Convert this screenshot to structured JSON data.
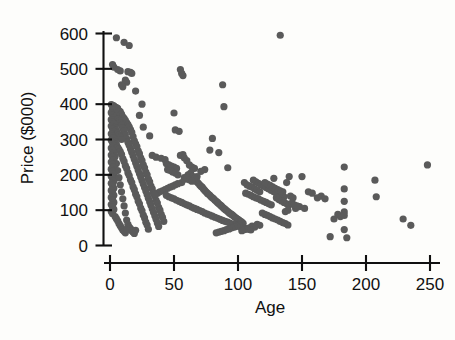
{
  "figure": {
    "type": "scatter-plot",
    "background_color": "#fdfdfb",
    "marker_color": "#5a5a5a",
    "axis_color": "#101010"
  },
  "axis": {
    "y_title": "Price ($000)",
    "x_title": "Age",
    "y_ticks": [
      "0",
      "100",
      "200",
      "300",
      "400",
      "500",
      "600"
    ],
    "x_ticks": [
      "0",
      "50",
      "100",
      "150",
      "200",
      "250"
    ]
  },
  "chart_data": {
    "type": "scatter",
    "title": "",
    "xlabel": "Age",
    "ylabel": "Price ($000)",
    "xlim": [
      0,
      250
    ],
    "ylim": [
      0,
      600
    ],
    "xticks": [
      0,
      50,
      100,
      150,
      200,
      250
    ],
    "yticks": [
      0,
      100,
      200,
      300,
      400,
      500,
      600
    ],
    "grid": false,
    "legend": "none",
    "marker": "filled-circle",
    "marker_color": "#5a5a5a",
    "n_points": 452,
    "points": [
      [
        5,
        588
      ],
      [
        11,
        575
      ],
      [
        15,
        566
      ],
      [
        2,
        512
      ],
      [
        3,
        505
      ],
      [
        6,
        498
      ],
      [
        8,
        494
      ],
      [
        14,
        492
      ],
      [
        16,
        490
      ],
      [
        17,
        487
      ],
      [
        12,
        468
      ],
      [
        13,
        462
      ],
      [
        9,
        455
      ],
      [
        10,
        449
      ],
      [
        20,
        437
      ],
      [
        25,
        400
      ],
      [
        1,
        399
      ],
      [
        2,
        397
      ],
      [
        3,
        395
      ],
      [
        4,
        392
      ],
      [
        5,
        390
      ],
      [
        6,
        388
      ],
      [
        2,
        385
      ],
      [
        3,
        383
      ],
      [
        7,
        381
      ],
      [
        8,
        379
      ],
      [
        1,
        376
      ],
      [
        4,
        374
      ],
      [
        9,
        372
      ],
      [
        2,
        370
      ],
      [
        23,
        368
      ],
      [
        5,
        366
      ],
      [
        10,
        364
      ],
      [
        3,
        362
      ],
      [
        11,
        360
      ],
      [
        6,
        358
      ],
      [
        1,
        356
      ],
      [
        12,
        354
      ],
      [
        7,
        352
      ],
      [
        2,
        350
      ],
      [
        13,
        348
      ],
      [
        8,
        346
      ],
      [
        3,
        344
      ],
      [
        14,
        342
      ],
      [
        9,
        340
      ],
      [
        1,
        338
      ],
      [
        15,
        336
      ],
      [
        4,
        334
      ],
      [
        10,
        332
      ],
      [
        2,
        330
      ],
      [
        16,
        328
      ],
      [
        5,
        326
      ],
      [
        11,
        324
      ],
      [
        3,
        322
      ],
      [
        17,
        320
      ],
      [
        6,
        318
      ],
      [
        1,
        316
      ],
      [
        12,
        314
      ],
      [
        7,
        312
      ],
      [
        2,
        310
      ],
      [
        18,
        308
      ],
      [
        8,
        306
      ],
      [
        3,
        304
      ],
      [
        13,
        302
      ],
      [
        9,
        300
      ],
      [
        1,
        298
      ],
      [
        19,
        296
      ],
      [
        4,
        294
      ],
      [
        14,
        292
      ],
      [
        2,
        290
      ],
      [
        20,
        288
      ],
      [
        5,
        286
      ],
      [
        15,
        284
      ],
      [
        3,
        282
      ],
      [
        21,
        280
      ],
      [
        6,
        278
      ],
      [
        1,
        276
      ],
      [
        16,
        274
      ],
      [
        7,
        272
      ],
      [
        2,
        270
      ],
      [
        22,
        268
      ],
      [
        8,
        266
      ],
      [
        17,
        264
      ],
      [
        3,
        262
      ],
      [
        23,
        260
      ],
      [
        9,
        258
      ],
      [
        1,
        256
      ],
      [
        18,
        254
      ],
      [
        4,
        252
      ],
      [
        2,
        250
      ],
      [
        24,
        248
      ],
      [
        10,
        246
      ],
      [
        19,
        244
      ],
      [
        3,
        242
      ],
      [
        25,
        240
      ],
      [
        11,
        238
      ],
      [
        1,
        236
      ],
      [
        20,
        234
      ],
      [
        5,
        232
      ],
      [
        2,
        230
      ],
      [
        26,
        228
      ],
      [
        12,
        226
      ],
      [
        21,
        224
      ],
      [
        3,
        222
      ],
      [
        27,
        220
      ],
      [
        13,
        218
      ],
      [
        1,
        216
      ],
      [
        22,
        214
      ],
      [
        6,
        212
      ],
      [
        2,
        210
      ],
      [
        28,
        208
      ],
      [
        14,
        206
      ],
      [
        23,
        204
      ],
      [
        3,
        202
      ],
      [
        29,
        200
      ],
      [
        15,
        198
      ],
      [
        1,
        196
      ],
      [
        24,
        194
      ],
      [
        7,
        192
      ],
      [
        2,
        190
      ],
      [
        30,
        188
      ],
      [
        16,
        186
      ],
      [
        25,
        184
      ],
      [
        3,
        182
      ],
      [
        31,
        180
      ],
      [
        17,
        178
      ],
      [
        1,
        176
      ],
      [
        26,
        174
      ],
      [
        8,
        172
      ],
      [
        2,
        170
      ],
      [
        32,
        168
      ],
      [
        18,
        166
      ],
      [
        27,
        164
      ],
      [
        3,
        162
      ],
      [
        33,
        160
      ],
      [
        19,
        158
      ],
      [
        1,
        156
      ],
      [
        28,
        154
      ],
      [
        9,
        152
      ],
      [
        2,
        150
      ],
      [
        34,
        148
      ],
      [
        20,
        146
      ],
      [
        29,
        144
      ],
      [
        3,
        142
      ],
      [
        35,
        140
      ],
      [
        21,
        138
      ],
      [
        1,
        136
      ],
      [
        30,
        134
      ],
      [
        10,
        132
      ],
      [
        2,
        130
      ],
      [
        36,
        128
      ],
      [
        22,
        126
      ],
      [
        31,
        124
      ],
      [
        3,
        122
      ],
      [
        37,
        120
      ],
      [
        23,
        118
      ],
      [
        1,
        116
      ],
      [
        32,
        114
      ],
      [
        11,
        112
      ],
      [
        2,
        110
      ],
      [
        38,
        108
      ],
      [
        24,
        106
      ],
      [
        33,
        104
      ],
      [
        3,
        102
      ],
      [
        39,
        100
      ],
      [
        25,
        98
      ],
      [
        1,
        96
      ],
      [
        34,
        94
      ],
      [
        12,
        92
      ],
      [
        2,
        90
      ],
      [
        40,
        88
      ],
      [
        26,
        86
      ],
      [
        35,
        84
      ],
      [
        4,
        82
      ],
      [
        41,
        80
      ],
      [
        27,
        78
      ],
      [
        5,
        76
      ],
      [
        36,
        74
      ],
      [
        13,
        72
      ],
      [
        6,
        70
      ],
      [
        42,
        68
      ],
      [
        28,
        66
      ],
      [
        37,
        64
      ],
      [
        7,
        62
      ],
      [
        14,
        60
      ],
      [
        29,
        58
      ],
      [
        8,
        56
      ],
      [
        38,
        54
      ],
      [
        15,
        52
      ],
      [
        9,
        50
      ],
      [
        16,
        48
      ],
      [
        30,
        46
      ],
      [
        10,
        44
      ],
      [
        17,
        42
      ],
      [
        11,
        40
      ],
      [
        18,
        38
      ],
      [
        12,
        36
      ],
      [
        19,
        34
      ],
      [
        13,
        45
      ],
      [
        20,
        43
      ],
      [
        26,
        335
      ],
      [
        31,
        310
      ],
      [
        33,
        255
      ],
      [
        36,
        250
      ],
      [
        40,
        247
      ],
      [
        43,
        243
      ],
      [
        44,
        232
      ],
      [
        46,
        228
      ],
      [
        48,
        225
      ],
      [
        50,
        222
      ],
      [
        52,
        218
      ],
      [
        45,
        215
      ],
      [
        47,
        212
      ],
      [
        49,
        208
      ],
      [
        51,
        205
      ],
      [
        53,
        200
      ],
      [
        55,
        498
      ],
      [
        56,
        487
      ],
      [
        57,
        481
      ],
      [
        50,
        375
      ],
      [
        51,
        327
      ],
      [
        54,
        323
      ],
      [
        57,
        257
      ],
      [
        60,
        240
      ],
      [
        62,
        228
      ],
      [
        64,
        222
      ],
      [
        66,
        218
      ],
      [
        63,
        205
      ],
      [
        61,
        200
      ],
      [
        65,
        195
      ],
      [
        58,
        192
      ],
      [
        59,
        188
      ],
      [
        67,
        185
      ],
      [
        68,
        180
      ],
      [
        69,
        176
      ],
      [
        70,
        172
      ],
      [
        71,
        168
      ],
      [
        72,
        165
      ],
      [
        73,
        160
      ],
      [
        74,
        156
      ],
      [
        75,
        152
      ],
      [
        76,
        148
      ],
      [
        77,
        145
      ],
      [
        78,
        142
      ],
      [
        79,
        138
      ],
      [
        80,
        135
      ],
      [
        81,
        132
      ],
      [
        82,
        128
      ],
      [
        83,
        125
      ],
      [
        84,
        122
      ],
      [
        85,
        118
      ],
      [
        86,
        115
      ],
      [
        87,
        112
      ],
      [
        88,
        108
      ],
      [
        89,
        105
      ],
      [
        90,
        102
      ],
      [
        91,
        99
      ],
      [
        92,
        96
      ],
      [
        93,
        93
      ],
      [
        94,
        90
      ],
      [
        95,
        88
      ],
      [
        96,
        85
      ],
      [
        97,
        82
      ],
      [
        98,
        79
      ],
      [
        99,
        76
      ],
      [
        100,
        74
      ],
      [
        101,
        71
      ],
      [
        102,
        68
      ],
      [
        103,
        66
      ],
      [
        104,
        63
      ],
      [
        88,
        455
      ],
      [
        89,
        393
      ],
      [
        80,
        303
      ],
      [
        78,
        270
      ],
      [
        85,
        263
      ],
      [
        92,
        220
      ],
      [
        74,
        215
      ],
      [
        71,
        210
      ],
      [
        68,
        195
      ],
      [
        66,
        190
      ],
      [
        55,
        255
      ],
      [
        58,
        248
      ],
      [
        60,
        192
      ],
      [
        62,
        186
      ],
      [
        64,
        182
      ],
      [
        56,
        178
      ],
      [
        53,
        175
      ],
      [
        51,
        172
      ],
      [
        49,
        168
      ],
      [
        47,
        165
      ],
      [
        45,
        162
      ],
      [
        43,
        158
      ],
      [
        41,
        155
      ],
      [
        39,
        152
      ],
      [
        37,
        148
      ],
      [
        35,
        145
      ],
      [
        44,
        142
      ],
      [
        46,
        138
      ],
      [
        48,
        135
      ],
      [
        50,
        132
      ],
      [
        52,
        128
      ],
      [
        54,
        125
      ],
      [
        56,
        122
      ],
      [
        58,
        118
      ],
      [
        60,
        115
      ],
      [
        62,
        112
      ],
      [
        64,
        108
      ],
      [
        66,
        105
      ],
      [
        68,
        102
      ],
      [
        70,
        99
      ],
      [
        72,
        96
      ],
      [
        74,
        92
      ],
      [
        76,
        89
      ],
      [
        78,
        86
      ],
      [
        80,
        83
      ],
      [
        82,
        80
      ],
      [
        84,
        77
      ],
      [
        86,
        74
      ],
      [
        88,
        71
      ],
      [
        90,
        68
      ],
      [
        92,
        66
      ],
      [
        94,
        63
      ],
      [
        96,
        60
      ],
      [
        98,
        58
      ],
      [
        100,
        55
      ],
      [
        102,
        53
      ],
      [
        104,
        50
      ],
      [
        106,
        48
      ],
      [
        108,
        46
      ],
      [
        110,
        44
      ],
      [
        105,
        178
      ],
      [
        107,
        172
      ],
      [
        109,
        168
      ],
      [
        111,
        165
      ],
      [
        113,
        160
      ],
      [
        115,
        156
      ],
      [
        117,
        152
      ],
      [
        106,
        148
      ],
      [
        108,
        145
      ],
      [
        110,
        142
      ],
      [
        112,
        138
      ],
      [
        114,
        135
      ],
      [
        116,
        132
      ],
      [
        118,
        128
      ],
      [
        120,
        125
      ],
      [
        122,
        122
      ],
      [
        124,
        118
      ],
      [
        126,
        115
      ],
      [
        112,
        185
      ],
      [
        114,
        180
      ],
      [
        116,
        176
      ],
      [
        118,
        172
      ],
      [
        120,
        168
      ],
      [
        122,
        164
      ],
      [
        124,
        160
      ],
      [
        126,
        156
      ],
      [
        128,
        152
      ],
      [
        130,
        148
      ],
      [
        132,
        145
      ],
      [
        134,
        142
      ],
      [
        136,
        138
      ],
      [
        138,
        178
      ],
      [
        140,
        195
      ],
      [
        128,
        190
      ],
      [
        130,
        135
      ],
      [
        132,
        130
      ],
      [
        134,
        126
      ],
      [
        136,
        122
      ],
      [
        138,
        118
      ],
      [
        140,
        115
      ],
      [
        135,
        152
      ],
      [
        133,
        155
      ],
      [
        131,
        158
      ],
      [
        129,
        162
      ],
      [
        127,
        166
      ],
      [
        125,
        170
      ],
      [
        123,
        174
      ],
      [
        121,
        178
      ],
      [
        119,
        92
      ],
      [
        121,
        88
      ],
      [
        123,
        85
      ],
      [
        125,
        82
      ],
      [
        127,
        78
      ],
      [
        129,
        75
      ],
      [
        131,
        72
      ],
      [
        133,
        68
      ],
      [
        135,
        65
      ],
      [
        137,
        62
      ],
      [
        139,
        58
      ],
      [
        141,
        140
      ],
      [
        143,
        135
      ],
      [
        115,
        60
      ],
      [
        117,
        57
      ],
      [
        111,
        55
      ],
      [
        113,
        52
      ],
      [
        109,
        50
      ],
      [
        107,
        47
      ],
      [
        105,
        45
      ],
      [
        103,
        42
      ],
      [
        101,
        58
      ],
      [
        99,
        55
      ],
      [
        97,
        52
      ],
      [
        95,
        50
      ],
      [
        93,
        47
      ],
      [
        91,
        45
      ],
      [
        89,
        42
      ],
      [
        87,
        40
      ],
      [
        85,
        38
      ],
      [
        83,
        36
      ],
      [
        133,
        595
      ],
      [
        145,
        105
      ],
      [
        148,
        110
      ],
      [
        152,
        105
      ],
      [
        150,
        195
      ],
      [
        155,
        152
      ],
      [
        158,
        148
      ],
      [
        162,
        135
      ],
      [
        172,
        25
      ],
      [
        175,
        75
      ],
      [
        178,
        88
      ],
      [
        180,
        82
      ],
      [
        183,
        222
      ],
      [
        183,
        160
      ],
      [
        183,
        125
      ],
      [
        183,
        95
      ],
      [
        183,
        85
      ],
      [
        183,
        45
      ],
      [
        185,
        22
      ],
      [
        207,
        185
      ],
      [
        208,
        138
      ],
      [
        229,
        75
      ],
      [
        235,
        57
      ],
      [
        248,
        228
      ],
      [
        165,
        140
      ],
      [
        168,
        132
      ],
      [
        142,
        120
      ],
      [
        144,
        115
      ],
      [
        146,
        112
      ],
      [
        137,
        96
      ],
      [
        139,
        100
      ]
    ]
  }
}
